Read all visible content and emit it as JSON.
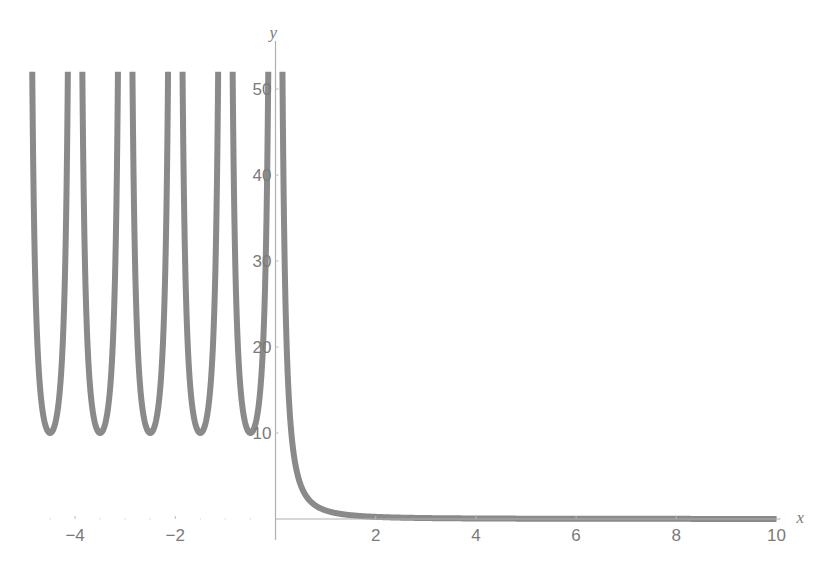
{
  "chart_data": {
    "type": "line",
    "title": "",
    "xlabel": "x",
    "ylabel": "y",
    "xlim": [
      -5,
      10
    ],
    "ylim": [
      0,
      52
    ],
    "grid": false,
    "legend": "none",
    "x_ticks": [
      {
        "value": -4,
        "label": "−4"
      },
      {
        "value": -2,
        "label": "−2"
      },
      {
        "value": 2,
        "label": "2"
      },
      {
        "value": 4,
        "label": "4"
      },
      {
        "value": 6,
        "label": "6"
      },
      {
        "value": 8,
        "label": "8"
      },
      {
        "value": 10,
        "label": "10"
      }
    ],
    "y_ticks": [
      {
        "value": 10,
        "label": "10"
      },
      {
        "value": 20,
        "label": "20"
      },
      {
        "value": 30,
        "label": "30"
      },
      {
        "value": 40,
        "label": "40"
      },
      {
        "value": 50,
        "label": "50"
      }
    ],
    "x_minor_ticks": [
      -4.5,
      -3.5,
      -3,
      -2.5,
      -1.5,
      -1,
      -0.5
    ],
    "series": [
      {
        "name": "left-branch",
        "description": "Periodic U-shaped branches on x<0 with vertical asymptotes at integers, minima ≈10 at half-integers",
        "formula": "10/sin(pi*x)^2",
        "domain": [
          -5,
          0
        ],
        "minima": [
          {
            "x": -4.5,
            "y": 10
          },
          {
            "x": -3.5,
            "y": 10
          },
          {
            "x": -2.5,
            "y": 10
          },
          {
            "x": -1.5,
            "y": 10
          },
          {
            "x": -0.5,
            "y": 10
          }
        ],
        "asymptotes_x": [
          -5,
          -4,
          -3,
          -2,
          -1,
          0
        ]
      },
      {
        "name": "right-branch",
        "description": "Decaying branch on x>0 approaching 0",
        "formula": "1/x^2",
        "domain": [
          0,
          10
        ],
        "points": [
          {
            "x": 0.14,
            "y": 51
          },
          {
            "x": 0.32,
            "y": 10
          },
          {
            "x": 0.5,
            "y": 4
          },
          {
            "x": 1,
            "y": 1
          },
          {
            "x": 2,
            "y": 0.25
          },
          {
            "x": 4,
            "y": 0.06
          },
          {
            "x": 10,
            "y": 0.01
          }
        ]
      }
    ]
  }
}
